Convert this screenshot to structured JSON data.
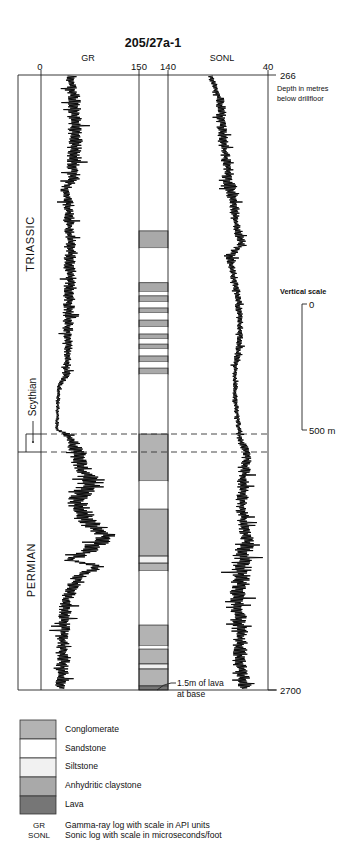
{
  "title": "205/27a-1",
  "tracks": {
    "gr": {
      "label": "GR",
      "min_label": "0",
      "max_label": "150"
    },
    "sonl": {
      "label": "SONL",
      "min_label": "140",
      "max_label": "40"
    }
  },
  "depth": {
    "top_label": "266",
    "bottom_label": "2700",
    "caption_line1": "Depth in metres",
    "caption_line2": "below drillfloor"
  },
  "periods": {
    "upper": "TRIASSIC",
    "stage": "Scythian",
    "lower": "PERMIAN"
  },
  "vertical_scale": {
    "title": "Vertical scale",
    "top_label": "0",
    "bottom_label": "500 m"
  },
  "annotation": {
    "line1": "1.5m of lava",
    "line2": "at base"
  },
  "legend": {
    "items": [
      {
        "label": "Conglomerate",
        "color": "#b3b3b3"
      },
      {
        "label": "Sandstone",
        "color": "#ffffff"
      },
      {
        "label": "Siltstone",
        "color": "#f1f1f1"
      },
      {
        "label": "Anhydritic claystone",
        "color": "#a9a9a9"
      },
      {
        "label": "Lava",
        "color": "#767676"
      }
    ],
    "logs": [
      {
        "abbr": "GR",
        "description": "Gamma-ray log with scale in API units"
      },
      {
        "abbr": "SONL",
        "description": "Sonic log with scale in microseconds/foot"
      }
    ]
  },
  "chart_data": {
    "type": "line",
    "title": "205/27a-1",
    "y_axis": {
      "label": "Depth in metres below drillfloor",
      "range": [
        266,
        2700
      ],
      "inverted": true
    },
    "grid": false,
    "point_format": "[depth_m, value, noise_amplitude]",
    "series": [
      {
        "name": "GR",
        "description": "Gamma-ray log with scale in API units",
        "x_range": [
          0,
          150
        ],
        "points": [
          [
            266,
            45,
            10
          ],
          [
            365,
            50,
            12
          ],
          [
            523,
            52,
            14
          ],
          [
            682,
            50,
            12
          ],
          [
            720,
            36,
            8
          ],
          [
            761,
            42,
            10
          ],
          [
            919,
            44,
            10
          ],
          [
            1077,
            45,
            12
          ],
          [
            1236,
            42,
            10
          ],
          [
            1394,
            40,
            8
          ],
          [
            1453,
            38,
            8
          ],
          [
            1500,
            27,
            4
          ],
          [
            1671,
            24,
            3
          ],
          [
            1687,
            40,
            12
          ],
          [
            1758,
            56,
            15
          ],
          [
            1829,
            62,
            15
          ],
          [
            1869,
            80,
            25
          ],
          [
            1948,
            55,
            20
          ],
          [
            2027,
            68,
            20
          ],
          [
            2087,
            100,
            20
          ],
          [
            2146,
            75,
            20
          ],
          [
            2186,
            42,
            10
          ],
          [
            2210,
            90,
            15
          ],
          [
            2245,
            60,
            15
          ],
          [
            2344,
            38,
            12
          ],
          [
            2502,
            33,
            12
          ],
          [
            2582,
            34,
            12
          ],
          [
            2700,
            30,
            10
          ]
        ]
      },
      {
        "name": "SONL",
        "description": "Sonic log with scale in microseconds/foot",
        "x_range": [
          140,
          40
        ],
        "points": [
          [
            266,
            98,
            4
          ],
          [
            365,
            88,
            6
          ],
          [
            523,
            85,
            6
          ],
          [
            642,
            80,
            5
          ],
          [
            697,
            80,
            10
          ],
          [
            761,
            75,
            6
          ],
          [
            879,
            71,
            5
          ],
          [
            939,
            66,
            6
          ],
          [
            978,
            78,
            6
          ],
          [
            998,
            78,
            5
          ],
          [
            1117,
            71,
            4
          ],
          [
            1236,
            68,
            4
          ],
          [
            1315,
            68,
            4
          ],
          [
            1434,
            73,
            3
          ],
          [
            1552,
            73,
            3
          ],
          [
            1631,
            70,
            3
          ],
          [
            1711,
            68,
            4
          ],
          [
            1758,
            61,
            6
          ],
          [
            1790,
            61,
            6
          ],
          [
            1869,
            65,
            8
          ],
          [
            1988,
            66,
            7
          ],
          [
            2106,
            61,
            8
          ],
          [
            2205,
            66,
            12
          ],
          [
            2344,
            70,
            10
          ],
          [
            2463,
            68,
            10
          ],
          [
            2582,
            68,
            8
          ],
          [
            2700,
            63,
            8
          ]
        ]
      }
    ],
    "lithology": [
      {
        "from": 266,
        "to": 883,
        "type": "Sandstone"
      },
      {
        "from": 883,
        "to": 951,
        "type": "Anhydritic claystone"
      },
      {
        "from": 951,
        "to": 1088,
        "type": "Sandstone"
      },
      {
        "from": 1088,
        "to": 1124,
        "type": "Anhydritic claystone"
      },
      {
        "from": 1124,
        "to": 1140,
        "type": "Sandstone"
      },
      {
        "from": 1140,
        "to": 1164,
        "type": "Anhydritic claystone"
      },
      {
        "from": 1164,
        "to": 1188,
        "type": "Sandstone"
      },
      {
        "from": 1188,
        "to": 1208,
        "type": "Anhydritic claystone"
      },
      {
        "from": 1208,
        "to": 1236,
        "type": "Sandstone"
      },
      {
        "from": 1236,
        "to": 1263,
        "type": "Anhydritic claystone"
      },
      {
        "from": 1263,
        "to": 1291,
        "type": "Sandstone"
      },
      {
        "from": 1291,
        "to": 1311,
        "type": "Anhydritic claystone"
      },
      {
        "from": 1311,
        "to": 1331,
        "type": "Sandstone"
      },
      {
        "from": 1331,
        "to": 1350,
        "type": "Anhydritic claystone"
      },
      {
        "from": 1350,
        "to": 1378,
        "type": "Sandstone"
      },
      {
        "from": 1378,
        "to": 1402,
        "type": "Anhydritic claystone"
      },
      {
        "from": 1402,
        "to": 1426,
        "type": "Sandstone"
      },
      {
        "from": 1426,
        "to": 1450,
        "type": "Anhydritic claystone"
      },
      {
        "from": 1450,
        "to": 1687,
        "type": "Sandstone"
      },
      {
        "from": 1687,
        "to": 1873,
        "type": "Conglomerate"
      },
      {
        "from": 1873,
        "to": 1984,
        "type": "Sandstone"
      },
      {
        "from": 1984,
        "to": 2170,
        "type": "Conglomerate"
      },
      {
        "from": 2170,
        "to": 2198,
        "type": "Siltstone"
      },
      {
        "from": 2198,
        "to": 2229,
        "type": "Conglomerate"
      },
      {
        "from": 2229,
        "to": 2443,
        "type": "Sandstone"
      },
      {
        "from": 2443,
        "to": 2526,
        "type": "Conglomerate"
      },
      {
        "from": 2526,
        "to": 2538,
        "type": "Sandstone"
      },
      {
        "from": 2538,
        "to": 2597,
        "type": "Conglomerate"
      },
      {
        "from": 2597,
        "to": 2617,
        "type": "Siltstone"
      },
      {
        "from": 2617,
        "to": 2684,
        "type": "Conglomerate"
      },
      {
        "from": 2684,
        "to": 2700,
        "type": "Lava"
      }
    ],
    "boundaries": [
      {
        "depth": 1687,
        "style": "dashed"
      },
      {
        "depth": 1758,
        "style": "dashed"
      }
    ],
    "periods": [
      {
        "name": "TRIASSIC",
        "from": 266,
        "to": 1758
      },
      {
        "name": "Scythian",
        "from": 1687,
        "to": 1758
      },
      {
        "name": "PERMIAN",
        "from": 1758,
        "to": 2700
      }
    ],
    "annotations": [
      {
        "text": "1.5m of lava at base",
        "depth": 2700
      }
    ]
  }
}
